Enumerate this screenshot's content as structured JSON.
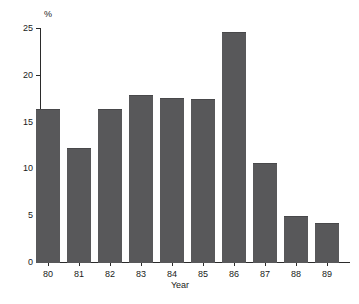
{
  "chart_data": {
    "type": "bar",
    "title": "",
    "xlabel": "Year",
    "ylabel": "%",
    "categories": [
      "80",
      "81",
      "82",
      "83",
      "84",
      "85",
      "86",
      "87",
      "88",
      "89"
    ],
    "values": [
      16.3,
      12.2,
      16.4,
      17.8,
      17.5,
      17.4,
      24.6,
      10.6,
      4.9,
      4.2
    ],
    "ylim": [
      0,
      25
    ],
    "yticks": [
      0,
      5,
      10,
      15,
      20,
      25
    ],
    "grid": false,
    "legend": false,
    "bar_color": "#58585a",
    "axis_color": "#2b2b2b",
    "text_color": "#1a1a1a",
    "background": "#ffffff"
  }
}
